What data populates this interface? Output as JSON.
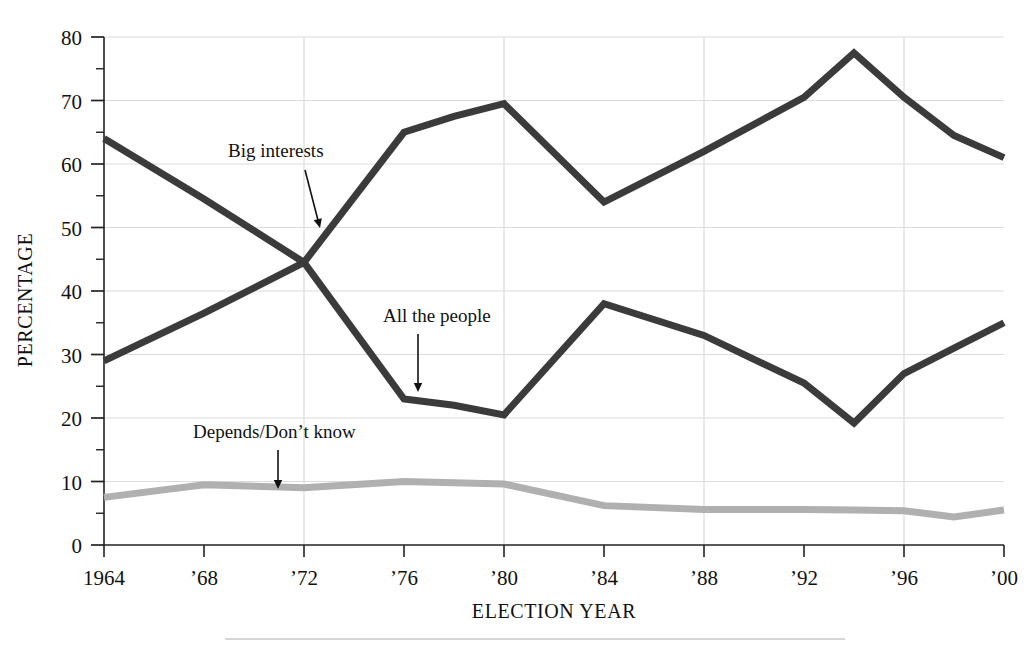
{
  "chart_data": {
    "type": "line",
    "title": "",
    "xlabel": "ELECTION YEAR",
    "ylabel": "PERCENTAGE",
    "xlim": [
      1964,
      2000
    ],
    "ylim": [
      0,
      80
    ],
    "grid": true,
    "legend_position": "inline-annotations",
    "x": [
      1964,
      1968,
      1972,
      1976,
      1978,
      1980,
      1984,
      1988,
      1992,
      1994,
      1996,
      1998,
      2000
    ],
    "xtick_labels": [
      "1964",
      "’68",
      "’72",
      "’76",
      "’80",
      "’84",
      "’88",
      "’92",
      "’96",
      "’00"
    ],
    "xtick_values": [
      1964,
      1968,
      1972,
      1976,
      1980,
      1984,
      1988,
      1992,
      1996,
      2000
    ],
    "ytick_labels": [
      "0",
      "10",
      "20",
      "30",
      "40",
      "50",
      "60",
      "70",
      "80"
    ],
    "ytick_values": [
      0,
      10,
      20,
      30,
      40,
      50,
      60,
      70,
      80
    ],
    "yminor_step": 5,
    "series": [
      {
        "name": "All the people",
        "color": "#3b3b3b",
        "x": [
          1964,
          1968,
          1972,
          1976,
          1978,
          1980,
          1984,
          1988,
          1992,
          1994,
          1996,
          1998,
          2000
        ],
        "values": [
          64.0,
          54.5,
          44.5,
          23.0,
          22.0,
          20.5,
          38.0,
          33.0,
          25.5,
          19.2,
          27.0,
          31.0,
          35.0
        ]
      },
      {
        "name": "Big interests",
        "color": "#3b3b3b",
        "x": [
          1964,
          1968,
          1972,
          1976,
          1978,
          1980,
          1984,
          1988,
          1992,
          1994,
          1996,
          1998,
          2000
        ],
        "values": [
          29.0,
          36.5,
          44.5,
          65.0,
          67.5,
          69.5,
          54.0,
          62.0,
          70.5,
          77.5,
          70.5,
          64.5,
          61.0
        ]
      },
      {
        "name": "Depends/Don’t know",
        "color": "#b0b0b0",
        "x": [
          1964,
          1968,
          1972,
          1976,
          1978,
          1980,
          1984,
          1988,
          1992,
          1994,
          1996,
          1998,
          2000
        ],
        "values": [
          7.5,
          9.5,
          9.0,
          10.0,
          9.8,
          9.6,
          6.2,
          5.6,
          5.6,
          5.5,
          5.4,
          4.4,
          5.5
        ]
      }
    ],
    "annotations": [
      {
        "label": "Big interests",
        "label_x": 228,
        "label_y": 157,
        "arrow_x1": 305,
        "arrow_y1": 170,
        "arrow_x2": 320,
        "arrow_y2": 228
      },
      {
        "label": "All the people",
        "label_x": 383,
        "label_y": 322,
        "arrow_x1": 418,
        "arrow_y1": 334,
        "arrow_x2": 418,
        "arrow_y2": 392
      },
      {
        "label": "Depends/Don’t know",
        "label_x": 193,
        "label_y": 438,
        "arrow_x1": 278,
        "arrow_y1": 450,
        "arrow_x2": 278,
        "arrow_y2": 489
      }
    ]
  },
  "figure": {
    "ylabel": "PERCENTAGE",
    "xlabel": "ELECTION YEAR",
    "footer_rule": true
  }
}
